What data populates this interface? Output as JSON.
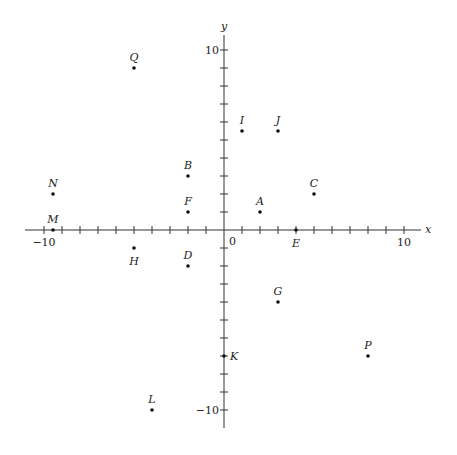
{
  "chart_data": {
    "type": "scatter",
    "title": "",
    "xlabel": "x",
    "ylabel": "y",
    "xlim": [
      -10.5,
      11
    ],
    "ylim": [
      -11,
      11
    ],
    "grid": false,
    "tick_step": 1,
    "tick_labels": {
      "x": [
        {
          "value": -10,
          "label": "−10"
        },
        {
          "value": 10,
          "label": "10"
        }
      ],
      "y": [
        {
          "value": 10,
          "label": "10"
        },
        {
          "value": -10,
          "label": "−10"
        }
      ],
      "origin": "0"
    },
    "points": [
      {
        "label": "Q",
        "x": -5,
        "y": 9,
        "label_pos": "above"
      },
      {
        "label": "I",
        "x": 1,
        "y": 5.5,
        "label_pos": "above"
      },
      {
        "label": "J",
        "x": 3,
        "y": 5.5,
        "label_pos": "above"
      },
      {
        "label": "B",
        "x": -2,
        "y": 3,
        "label_pos": "above"
      },
      {
        "label": "N",
        "x": -9.5,
        "y": 2,
        "label_pos": "above"
      },
      {
        "label": "C",
        "x": 5,
        "y": 2,
        "label_pos": "above"
      },
      {
        "label": "F",
        "x": -2,
        "y": 1,
        "label_pos": "above"
      },
      {
        "label": "A",
        "x": 2,
        "y": 1,
        "label_pos": "above"
      },
      {
        "label": "M",
        "x": -9.5,
        "y": 0,
        "label_pos": "above"
      },
      {
        "label": "E",
        "x": 4,
        "y": 0,
        "label_pos": "below"
      },
      {
        "label": "H",
        "x": -5,
        "y": -1,
        "label_pos": "below"
      },
      {
        "label": "D",
        "x": -2,
        "y": -2,
        "label_pos": "above"
      },
      {
        "label": "G",
        "x": 3,
        "y": -4,
        "label_pos": "above"
      },
      {
        "label": "K",
        "x": 0,
        "y": -7,
        "label_pos": "right"
      },
      {
        "label": "P",
        "x": 8,
        "y": -7,
        "label_pos": "above"
      },
      {
        "label": "L",
        "x": -4,
        "y": -10,
        "label_pos": "above"
      }
    ]
  }
}
